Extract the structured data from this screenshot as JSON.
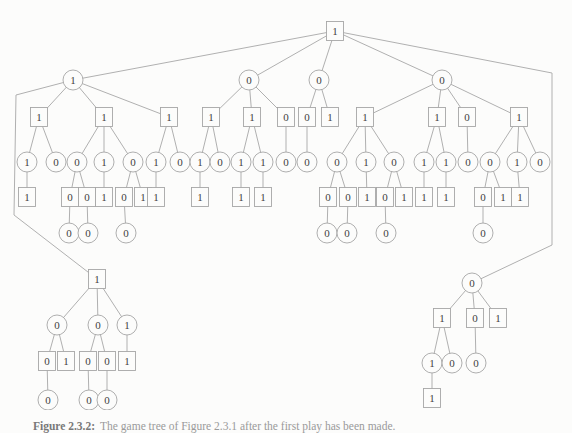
{
  "style": {
    "background": "#fcfcfb",
    "line_color": "#b0b0b0",
    "node_stroke": "#a6a6a6",
    "node_fill": "#fcfcfb",
    "label_color": "#3f3f3f",
    "square_w": 17,
    "square_h": 19,
    "circle_r": 10,
    "font_size": 11
  },
  "caption": {
    "prefix": "Figure 2.3.2:",
    "text": "The game tree of Figure 2.3.1 after the first play has been made."
  },
  "tree": {
    "description": "game tree; squares and circles labeled 0/1",
    "nodes": [
      {
        "id": "R",
        "shape": "square",
        "label": "1",
        "x": 335,
        "y": 31
      },
      {
        "id": "n1",
        "shape": "circle",
        "label": "1",
        "x": 73,
        "y": 80
      },
      {
        "id": "n0a",
        "shape": "circle",
        "label": "0",
        "x": 249,
        "y": 80
      },
      {
        "id": "n0b",
        "shape": "circle",
        "label": "0",
        "x": 319,
        "y": 80
      },
      {
        "id": "n0c",
        "shape": "circle",
        "label": "0",
        "x": 442,
        "y": 80
      },
      {
        "id": "a1",
        "shape": "square",
        "label": "1",
        "x": 39,
        "y": 117
      },
      {
        "id": "a2",
        "shape": "square",
        "label": "1",
        "x": 104,
        "y": 117
      },
      {
        "id": "a3",
        "shape": "square",
        "label": "1",
        "x": 169,
        "y": 117
      },
      {
        "id": "b1",
        "shape": "square",
        "label": "1",
        "x": 211,
        "y": 117
      },
      {
        "id": "b2",
        "shape": "square",
        "label": "1",
        "x": 252,
        "y": 117
      },
      {
        "id": "b3",
        "shape": "square",
        "label": "0",
        "x": 286,
        "y": 117
      },
      {
        "id": "c1",
        "shape": "square",
        "label": "0",
        "x": 307,
        "y": 117
      },
      {
        "id": "c2",
        "shape": "square",
        "label": "1",
        "x": 330,
        "y": 117
      },
      {
        "id": "d1",
        "shape": "square",
        "label": "1",
        "x": 365,
        "y": 117
      },
      {
        "id": "d2",
        "shape": "square",
        "label": "1",
        "x": 437,
        "y": 117
      },
      {
        "id": "d3",
        "shape": "square",
        "label": "0",
        "x": 467,
        "y": 117
      },
      {
        "id": "d4",
        "shape": "square",
        "label": "1",
        "x": 519,
        "y": 117
      },
      {
        "id": "a1x",
        "shape": "circle",
        "label": "1",
        "x": 27,
        "y": 162
      },
      {
        "id": "a1y",
        "shape": "circle",
        "label": "0",
        "x": 56,
        "y": 162
      },
      {
        "id": "a2x",
        "shape": "circle",
        "label": "0",
        "x": 77,
        "y": 162
      },
      {
        "id": "a2y",
        "shape": "circle",
        "label": "1",
        "x": 104,
        "y": 162
      },
      {
        "id": "a2z",
        "shape": "circle",
        "label": "0",
        "x": 133,
        "y": 162
      },
      {
        "id": "a3x",
        "shape": "circle",
        "label": "1",
        "x": 156,
        "y": 162
      },
      {
        "id": "a3y",
        "shape": "circle",
        "label": "0",
        "x": 180,
        "y": 162
      },
      {
        "id": "b1x",
        "shape": "circle",
        "label": "1",
        "x": 200,
        "y": 162
      },
      {
        "id": "b1y",
        "shape": "circle",
        "label": "0",
        "x": 220,
        "y": 162
      },
      {
        "id": "b2x",
        "shape": "circle",
        "label": "1",
        "x": 241,
        "y": 162
      },
      {
        "id": "b2y",
        "shape": "circle",
        "label": "1",
        "x": 263,
        "y": 162
      },
      {
        "id": "b3x",
        "shape": "circle",
        "label": "0",
        "x": 286,
        "y": 162
      },
      {
        "id": "c1x",
        "shape": "circle",
        "label": "0",
        "x": 307,
        "y": 162
      },
      {
        "id": "d1x",
        "shape": "circle",
        "label": "0",
        "x": 337,
        "y": 162
      },
      {
        "id": "d1y",
        "shape": "circle",
        "label": "1",
        "x": 366,
        "y": 162
      },
      {
        "id": "d1z",
        "shape": "circle",
        "label": "0",
        "x": 394,
        "y": 162
      },
      {
        "id": "d2x",
        "shape": "circle",
        "label": "1",
        "x": 424,
        "y": 162
      },
      {
        "id": "d2y",
        "shape": "circle",
        "label": "1",
        "x": 446,
        "y": 162
      },
      {
        "id": "d3x",
        "shape": "circle",
        "label": "0",
        "x": 468,
        "y": 162
      },
      {
        "id": "d4x",
        "shape": "circle",
        "label": "0",
        "x": 490,
        "y": 162
      },
      {
        "id": "d4y",
        "shape": "circle",
        "label": "1",
        "x": 517,
        "y": 162
      },
      {
        "id": "d4z",
        "shape": "circle",
        "label": "0",
        "x": 540,
        "y": 162
      },
      {
        "id": "a1x1",
        "shape": "square",
        "label": "1",
        "x": 27,
        "y": 197
      },
      {
        "id": "a2x1",
        "shape": "square",
        "label": "0",
        "x": 70,
        "y": 197
      },
      {
        "id": "a2x2",
        "shape": "square",
        "label": "0",
        "x": 87,
        "y": 197
      },
      {
        "id": "a2y1",
        "shape": "square",
        "label": "1",
        "x": 104,
        "y": 197
      },
      {
        "id": "a2z1",
        "shape": "square",
        "label": "0",
        "x": 124,
        "y": 197
      },
      {
        "id": "a2z2",
        "shape": "square",
        "label": "1",
        "x": 143,
        "y": 197
      },
      {
        "id": "a3x1",
        "shape": "square",
        "label": "1",
        "x": 156,
        "y": 197
      },
      {
        "id": "b1x1",
        "shape": "square",
        "label": "1",
        "x": 200,
        "y": 197
      },
      {
        "id": "b2x1",
        "shape": "square",
        "label": "1",
        "x": 241,
        "y": 197
      },
      {
        "id": "b2y1",
        "shape": "square",
        "label": "1",
        "x": 263,
        "y": 197
      },
      {
        "id": "d1x1",
        "shape": "square",
        "label": "0",
        "x": 328,
        "y": 197
      },
      {
        "id": "d1x2",
        "shape": "square",
        "label": "0",
        "x": 348,
        "y": 197
      },
      {
        "id": "d1y1",
        "shape": "square",
        "label": "1",
        "x": 367,
        "y": 197
      },
      {
        "id": "d1z1",
        "shape": "square",
        "label": "0",
        "x": 385,
        "y": 197
      },
      {
        "id": "d1z2",
        "shape": "square",
        "label": "1",
        "x": 404,
        "y": 197
      },
      {
        "id": "d2x1",
        "shape": "square",
        "label": "1",
        "x": 424,
        "y": 197
      },
      {
        "id": "d2y1",
        "shape": "square",
        "label": "1",
        "x": 446,
        "y": 197
      },
      {
        "id": "d4x1",
        "shape": "square",
        "label": "0",
        "x": 483,
        "y": 197
      },
      {
        "id": "d4x2",
        "shape": "square",
        "label": "1",
        "x": 503,
        "y": 197
      },
      {
        "id": "d4y1",
        "shape": "square",
        "label": "1",
        "x": 520,
        "y": 197
      },
      {
        "id": "a2x1c",
        "shape": "circle",
        "label": "0",
        "x": 69,
        "y": 233
      },
      {
        "id": "a2x2c",
        "shape": "circle",
        "label": "0",
        "x": 88,
        "y": 233
      },
      {
        "id": "a2z1c",
        "shape": "circle",
        "label": "0",
        "x": 126,
        "y": 233
      },
      {
        "id": "d1x1c",
        "shape": "circle",
        "label": "0",
        "x": 327,
        "y": 233
      },
      {
        "id": "d1x2c",
        "shape": "circle",
        "label": "0",
        "x": 347,
        "y": 233
      },
      {
        "id": "d1z1c",
        "shape": "circle",
        "label": "0",
        "x": 386,
        "y": 233
      },
      {
        "id": "d4x1c",
        "shape": "circle",
        "label": "0",
        "x": 483,
        "y": 233
      },
      {
        "id": "m1",
        "shape": "square",
        "label": "1",
        "x": 97,
        "y": 279
      },
      {
        "id": "m1a",
        "shape": "circle",
        "label": "0",
        "x": 57,
        "y": 325
      },
      {
        "id": "m1b",
        "shape": "circle",
        "label": "0",
        "x": 98,
        "y": 325
      },
      {
        "id": "m1c",
        "shape": "circle",
        "label": "1",
        "x": 127,
        "y": 325
      },
      {
        "id": "m1a1",
        "shape": "square",
        "label": "0",
        "x": 47,
        "y": 361
      },
      {
        "id": "m1a2",
        "shape": "square",
        "label": "1",
        "x": 66,
        "y": 361
      },
      {
        "id": "m1b1",
        "shape": "square",
        "label": "0",
        "x": 88,
        "y": 361
      },
      {
        "id": "m1b2",
        "shape": "square",
        "label": "0",
        "x": 107,
        "y": 361
      },
      {
        "id": "m1c1",
        "shape": "square",
        "label": "1",
        "x": 127,
        "y": 361
      },
      {
        "id": "m1a1c",
        "shape": "circle",
        "label": "0",
        "x": 48,
        "y": 400
      },
      {
        "id": "m1b1c",
        "shape": "circle",
        "label": "0",
        "x": 89,
        "y": 400
      },
      {
        "id": "m1b2c",
        "shape": "circle",
        "label": "0",
        "x": 107,
        "y": 400
      },
      {
        "id": "n0d",
        "shape": "circle",
        "label": "0",
        "x": 472,
        "y": 283
      },
      {
        "id": "q1",
        "shape": "square",
        "label": "1",
        "x": 442,
        "y": 318
      },
      {
        "id": "q2",
        "shape": "square",
        "label": "0",
        "x": 475,
        "y": 318
      },
      {
        "id": "q3",
        "shape": "square",
        "label": "1",
        "x": 498,
        "y": 318
      },
      {
        "id": "q1a",
        "shape": "circle",
        "label": "1",
        "x": 432,
        "y": 363
      },
      {
        "id": "q1b",
        "shape": "circle",
        "label": "0",
        "x": 452,
        "y": 363
      },
      {
        "id": "q2a",
        "shape": "circle",
        "label": "0",
        "x": 476,
        "y": 363
      },
      {
        "id": "q1a1",
        "shape": "square",
        "label": "1",
        "x": 432,
        "y": 398
      }
    ],
    "edges": [
      [
        "R",
        "n1"
      ],
      [
        "R",
        "n0a"
      ],
      [
        "R",
        "n0b"
      ],
      [
        "R",
        "n0c"
      ],
      {
        "from": "R",
        "to": "n0d",
        "via": [
          [
            552,
            73
          ],
          [
            552,
            245
          ]
        ]
      },
      {
        "from": "n1",
        "to": "m1",
        "via": [
          [
            16,
            95
          ],
          [
            14,
            215
          ]
        ]
      },
      [
        "n1",
        "a1"
      ],
      [
        "n1",
        "a2"
      ],
      [
        "n1",
        "a3"
      ],
      [
        "n0a",
        "b1"
      ],
      [
        "n0a",
        "b2"
      ],
      [
        "n0a",
        "b3"
      ],
      [
        "n0b",
        "c1"
      ],
      [
        "n0b",
        "c2"
      ],
      [
        "n0c",
        "d1"
      ],
      [
        "n0c",
        "d2"
      ],
      [
        "n0c",
        "d3"
      ],
      [
        "n0c",
        "d4"
      ],
      [
        "a1",
        "a1x"
      ],
      [
        "a1",
        "a1y"
      ],
      [
        "a2",
        "a2x"
      ],
      [
        "a2",
        "a2y"
      ],
      [
        "a2",
        "a2z"
      ],
      [
        "a3",
        "a3x"
      ],
      [
        "a3",
        "a3y"
      ],
      [
        "b1",
        "b1x"
      ],
      [
        "b1",
        "b1y"
      ],
      [
        "b2",
        "b2x"
      ],
      [
        "b2",
        "b2y"
      ],
      [
        "b3",
        "b3x"
      ],
      [
        "c1",
        "c1x"
      ],
      [
        "d1",
        "d1x"
      ],
      [
        "d1",
        "d1y"
      ],
      [
        "d1",
        "d1z"
      ],
      [
        "d2",
        "d2x"
      ],
      [
        "d2",
        "d2y"
      ],
      [
        "d3",
        "d3x"
      ],
      [
        "d4",
        "d4x"
      ],
      [
        "d4",
        "d4y"
      ],
      [
        "d4",
        "d4z"
      ],
      [
        "a1x",
        "a1x1"
      ],
      [
        "a2x",
        "a2x1"
      ],
      [
        "a2x",
        "a2x2"
      ],
      [
        "a2y",
        "a2y1"
      ],
      [
        "a2z",
        "a2z1"
      ],
      [
        "a2z",
        "a2z2"
      ],
      [
        "a3x",
        "a3x1"
      ],
      [
        "b1x",
        "b1x1"
      ],
      [
        "b2x",
        "b2x1"
      ],
      [
        "b2y",
        "b2y1"
      ],
      [
        "d1x",
        "d1x1"
      ],
      [
        "d1x",
        "d1x2"
      ],
      [
        "d1y",
        "d1y1"
      ],
      [
        "d1z",
        "d1z1"
      ],
      [
        "d1z",
        "d1z2"
      ],
      [
        "d2x",
        "d2x1"
      ],
      [
        "d2y",
        "d2y1"
      ],
      [
        "d4x",
        "d4x1"
      ],
      [
        "d4x",
        "d4x2"
      ],
      [
        "d4y",
        "d4y1"
      ],
      [
        "a2x1",
        "a2x1c"
      ],
      [
        "a2x2",
        "a2x2c"
      ],
      [
        "a2z1",
        "a2z1c"
      ],
      [
        "d1x1",
        "d1x1c"
      ],
      [
        "d1x2",
        "d1x2c"
      ],
      [
        "d1z1",
        "d1z1c"
      ],
      [
        "d4x1",
        "d4x1c"
      ],
      [
        "m1",
        "m1a"
      ],
      [
        "m1",
        "m1b"
      ],
      [
        "m1",
        "m1c"
      ],
      [
        "m1a",
        "m1a1"
      ],
      [
        "m1a",
        "m1a2"
      ],
      [
        "m1b",
        "m1b1"
      ],
      [
        "m1b",
        "m1b2"
      ],
      [
        "m1c",
        "m1c1"
      ],
      [
        "m1a1",
        "m1a1c"
      ],
      [
        "m1b1",
        "m1b1c"
      ],
      [
        "m1b2",
        "m1b2c"
      ],
      [
        "n0d",
        "q1"
      ],
      [
        "n0d",
        "q2"
      ],
      [
        "n0d",
        "q3"
      ],
      [
        "q1",
        "q1a"
      ],
      [
        "q1",
        "q1b"
      ],
      [
        "q2",
        "q2a"
      ],
      [
        "q1a",
        "q1a1"
      ]
    ]
  }
}
